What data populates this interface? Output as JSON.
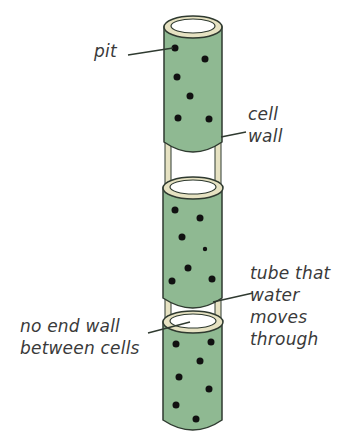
{
  "diagram": {
    "colors": {
      "cell_fill": "#8fb992",
      "cell_shade": "#7aa87e",
      "outline": "#2f3a30",
      "wall_ring": "#e6e2c2",
      "pit_dot": "#111111",
      "label_text": "#3a3a3a",
      "background": "#ffffff"
    },
    "cells": [
      {
        "name": "top-cell",
        "pits": 6
      },
      {
        "name": "middle-cell",
        "pits": 7
      },
      {
        "name": "bottom-cell",
        "pits": 7
      }
    ]
  },
  "labels": {
    "pit": {
      "lines": [
        "pit"
      ]
    },
    "cell_wall": {
      "lines": [
        "cell",
        "wall"
      ]
    },
    "tube": {
      "lines": [
        "tube that",
        "water",
        "moves",
        "through"
      ]
    },
    "no_end_wall": {
      "lines": [
        "no end wall",
        "between cells"
      ]
    }
  }
}
